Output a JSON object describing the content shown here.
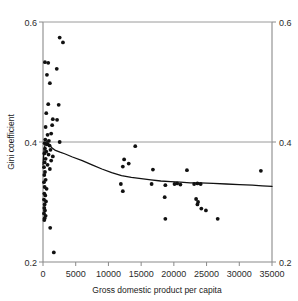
{
  "chart_data": {
    "type": "scatter",
    "title": "",
    "xlabel": "Gross domestic product per capita",
    "ylabel": "Gini coefficient",
    "y2label": "Gini coefficient",
    "xlim": [
      0,
      35000
    ],
    "ylim": [
      0.2,
      0.6
    ],
    "xticks": [
      0,
      5000,
      10000,
      15000,
      20000,
      25000,
      30000,
      35000
    ],
    "xtick_labels": [
      "0",
      "5000",
      "10000",
      "15000",
      "20000",
      "25000",
      "30000",
      "35000"
    ],
    "yticks": [
      0.2,
      0.4,
      0.6
    ],
    "ytick_labels": [
      "0.2",
      "0.4",
      "0.6"
    ],
    "y2tick_labels": [
      "0.2",
      "0.4",
      "0.6"
    ],
    "grid": "horizontal gridlines at 0.4 and 0.6",
    "legend": "none",
    "marker_color": "#111111",
    "trend_color": "#111111",
    "axis_color": "#8a8a8a",
    "series": [
      {
        "name": "Countries",
        "marker": "filled-circle",
        "points": [
          [
            2550,
            0.574
          ],
          [
            3050,
            0.566
          ],
          [
            300,
            0.533
          ],
          [
            800,
            0.532
          ],
          [
            2100,
            0.522
          ],
          [
            600,
            0.512
          ],
          [
            1050,
            0.498
          ],
          [
            800,
            0.463
          ],
          [
            2400,
            0.462
          ],
          [
            500,
            0.448
          ],
          [
            1500,
            0.438
          ],
          [
            2150,
            0.437
          ],
          [
            1400,
            0.428
          ],
          [
            400,
            0.425
          ],
          [
            1250,
            0.414
          ],
          [
            700,
            0.412
          ],
          [
            350,
            0.404
          ],
          [
            900,
            0.402
          ],
          [
            2550,
            0.4
          ],
          [
            250,
            0.398
          ],
          [
            600,
            0.396
          ],
          [
            1000,
            0.394
          ],
          [
            300,
            0.389
          ],
          [
            1150,
            0.387
          ],
          [
            500,
            0.384
          ],
          [
            200,
            0.381
          ],
          [
            850,
            0.379
          ],
          [
            1500,
            0.376
          ],
          [
            400,
            0.372
          ],
          [
            1250,
            0.369
          ],
          [
            250,
            0.366
          ],
          [
            700,
            0.362
          ],
          [
            150,
            0.358
          ],
          [
            1050,
            0.355
          ],
          [
            300,
            0.35
          ],
          [
            200,
            0.345
          ],
          [
            400,
            0.337
          ],
          [
            150,
            0.333
          ],
          [
            250,
            0.325
          ],
          [
            550,
            0.322
          ],
          [
            200,
            0.314
          ],
          [
            350,
            0.311
          ],
          [
            150,
            0.304
          ],
          [
            450,
            0.301
          ],
          [
            250,
            0.296
          ],
          [
            200,
            0.29
          ],
          [
            300,
            0.286
          ],
          [
            150,
            0.281
          ],
          [
            400,
            0.277
          ],
          [
            250,
            0.273
          ],
          [
            200,
            0.27
          ],
          [
            1100,
            0.257
          ],
          [
            1650,
            0.216
          ],
          [
            14100,
            0.393
          ],
          [
            12400,
            0.371
          ],
          [
            13100,
            0.364
          ],
          [
            12200,
            0.359
          ],
          [
            16800,
            0.354
          ],
          [
            22000,
            0.353
          ],
          [
            33300,
            0.352
          ],
          [
            16600,
            0.33
          ],
          [
            18700,
            0.328
          ],
          [
            20100,
            0.33
          ],
          [
            20500,
            0.331
          ],
          [
            21000,
            0.329
          ],
          [
            23100,
            0.33
          ],
          [
            23600,
            0.331
          ],
          [
            24100,
            0.33
          ],
          [
            11900,
            0.33
          ],
          [
            12200,
            0.318
          ],
          [
            18600,
            0.308
          ],
          [
            23400,
            0.305
          ],
          [
            23700,
            0.3
          ],
          [
            23600,
            0.296
          ],
          [
            24200,
            0.289
          ],
          [
            24900,
            0.286
          ],
          [
            18700,
            0.272
          ],
          [
            26700,
            0.272
          ]
        ]
      }
    ],
    "trend_line": {
      "name": "Smoothed fit",
      "points": [
        [
          0,
          0.362
        ],
        [
          150,
          0.385
        ],
        [
          350,
          0.398
        ],
        [
          600,
          0.401
        ],
        [
          900,
          0.397
        ],
        [
          1300,
          0.391
        ],
        [
          1900,
          0.386
        ],
        [
          2600,
          0.383
        ],
        [
          3400,
          0.38
        ],
        [
          4500,
          0.375
        ],
        [
          6000,
          0.369
        ],
        [
          7500,
          0.362
        ],
        [
          9000,
          0.355
        ],
        [
          10500,
          0.349
        ],
        [
          12000,
          0.344
        ],
        [
          13500,
          0.341
        ],
        [
          15000,
          0.339
        ],
        [
          16500,
          0.337
        ],
        [
          18000,
          0.335
        ],
        [
          19500,
          0.334
        ],
        [
          21000,
          0.333
        ],
        [
          22500,
          0.332
        ],
        [
          24000,
          0.332
        ],
        [
          26000,
          0.331
        ],
        [
          28000,
          0.33
        ],
        [
          30000,
          0.329
        ],
        [
          32000,
          0.328
        ],
        [
          33500,
          0.327
        ],
        [
          35000,
          0.326
        ]
      ]
    }
  },
  "axes": {
    "left_title": "Gini coefficient",
    "bottom_title": "Gross domestic product per capita"
  }
}
